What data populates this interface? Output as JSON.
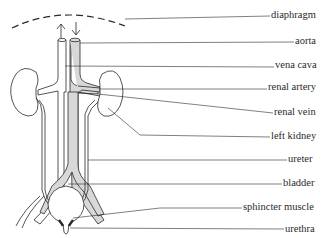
{
  "diagram": {
    "colors": {
      "line": "#2a2a2a",
      "shade": "#d8d8d8",
      "background": "#ffffff"
    },
    "labels": [
      {
        "text": "diaphragm",
        "x": 271,
        "y": 9
      },
      {
        "text": "aorta",
        "x": 295,
        "y": 34
      },
      {
        "text": "vena cava",
        "x": 275,
        "y": 58
      },
      {
        "text": "renal artery",
        "x": 268,
        "y": 81
      },
      {
        "text": "renal vein",
        "x": 274,
        "y": 106
      },
      {
        "text": "left kidney",
        "x": 271,
        "y": 130
      },
      {
        "text": "ureter",
        "x": 288,
        "y": 154
      },
      {
        "text": "bladder",
        "x": 283,
        "y": 178
      },
      {
        "text": "sphincter muscle",
        "x": 243,
        "y": 202
      },
      {
        "text": "urethra",
        "x": 285,
        "y": 225
      }
    ]
  }
}
